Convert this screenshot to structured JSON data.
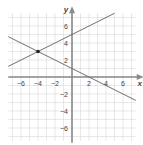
{
  "chart_data": {
    "type": "line",
    "title": "",
    "xlabel": "x",
    "ylabel": "y",
    "xlim": [
      -7.5,
      7.5
    ],
    "ylim": [
      -7.5,
      7.5
    ],
    "grid": true,
    "x_ticks": [
      -6,
      -4,
      -2,
      2,
      4,
      6
    ],
    "y_ticks": [
      6,
      4,
      2,
      -2,
      -4,
      -6
    ],
    "x_tick_labels": [
      "−6",
      "−4",
      "−2",
      "2",
      "4",
      "6"
    ],
    "y_tick_labels": [
      "6",
      "4",
      "2",
      "−2",
      "−4",
      "−6"
    ],
    "series": [
      {
        "name": "line-rising",
        "equation": "y = 0.5x + 5",
        "x": [
          -7.5,
          5
        ],
        "y": [
          1.25,
          7.5
        ]
      },
      {
        "name": "line-falling",
        "equation": "y = -0.5x + 1",
        "x": [
          -7.5,
          7.5
        ],
        "y": [
          4.75,
          -2.75
        ]
      }
    ],
    "points": [
      {
        "name": "intersection",
        "x": -4,
        "y": 3
      }
    ],
    "colors": {
      "grid": "#d9d9d9",
      "axis": "#8a8a8a",
      "line": "#6e6e6e",
      "point": "#222222",
      "text": "#444444"
    }
  }
}
